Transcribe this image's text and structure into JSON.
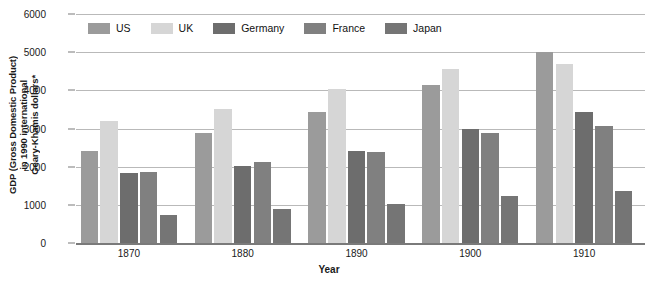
{
  "chart_data": {
    "type": "bar",
    "title": "",
    "xlabel": "Year",
    "ylabel": "GDP (Gross Domestic Product) in 1990 international Geary-Khamis dollars*",
    "ylabel_lines": [
      "GDP (Gross Domestic Product)",
      "in 1990 international",
      "Geary-Khamis dollars*"
    ],
    "categories": [
      "1870",
      "1880",
      "1890",
      "1900",
      "1910"
    ],
    "ylim": [
      0,
      6000
    ],
    "yticks": [
      0,
      1000,
      2000,
      3000,
      4000,
      5000,
      6000
    ],
    "ytick_labels": [
      "0",
      "1000",
      "2000",
      "3000",
      "4000",
      "5000",
      "6000"
    ],
    "grid": true,
    "legend_position": "top-left",
    "series": [
      {
        "name": "US",
        "color": "#9b9b9b",
        "values": [
          2410,
          2880,
          3430,
          4130,
          5000
        ]
      },
      {
        "name": "UK",
        "color": "#d6d6d6",
        "values": [
          3200,
          3500,
          4030,
          4570,
          4680
        ]
      },
      {
        "name": "Germany",
        "color": "#6d6d6d",
        "values": [
          1840,
          2030,
          2420,
          2990,
          3430
        ]
      },
      {
        "name": "France",
        "color": "#808080",
        "values": [
          1870,
          2130,
          2390,
          2870,
          3060
        ]
      },
      {
        "name": "Japan",
        "color": "#757575",
        "values": [
          740,
          880,
          1030,
          1230,
          1370
        ]
      }
    ]
  }
}
